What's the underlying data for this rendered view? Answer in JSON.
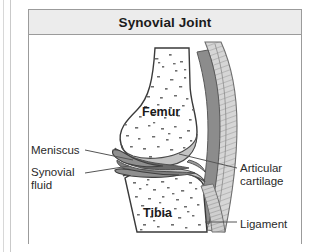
{
  "figure": {
    "title": "Synovial Joint",
    "colors": {
      "frame_border": "#9b9b9b",
      "title_background": "#ececec",
      "title_text": "#1b1b1b",
      "label_text": "#2a2a2a",
      "bone_outline": "#3a3a3a",
      "bone_fill": "#ffffff",
      "bone_speckle": "#6e6e6e",
      "cartilage_fill": "#c3c3c3",
      "meniscus_fill": "#8f8f8f",
      "synovial_fluid_fill": "#6a6a6a",
      "ligament_fill": "#d0d0d0",
      "leader_line": "#555555",
      "canvas_background": "#ffffff"
    }
  },
  "labels": {
    "meniscus": "Meniscus",
    "synovial_fluid": "Synovial fluid",
    "articular_cartilage": "Articular cartilage",
    "ligament": "Ligament",
    "femur": "Femur",
    "tibia": "Tibia"
  },
  "structures": [
    {
      "name": "femur",
      "kind": "bone",
      "position": "upper"
    },
    {
      "name": "tibia",
      "kind": "bone",
      "position": "lower"
    },
    {
      "name": "articular-cartilage",
      "kind": "cartilage",
      "position": "joint-surfaces"
    },
    {
      "name": "meniscus",
      "kind": "fibrocartilage",
      "position": "joint-space-wedges"
    },
    {
      "name": "synovial-fluid",
      "kind": "fluid",
      "position": "joint-cavity"
    },
    {
      "name": "ligament",
      "kind": "ligament",
      "position": "lateral-right"
    }
  ]
}
